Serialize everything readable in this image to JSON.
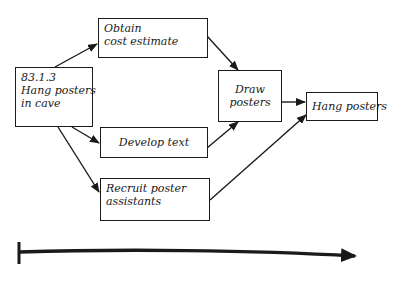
{
  "diagram": {
    "type": "activity-network",
    "nodes": [
      {
        "id": "root",
        "lines": [
          "83.1.3",
          "Hang posters",
          "in cave"
        ]
      },
      {
        "id": "cost",
        "lines": [
          "Obtain",
          "cost estimate"
        ]
      },
      {
        "id": "text",
        "lines": [
          "Develop text"
        ]
      },
      {
        "id": "recruit",
        "lines": [
          "Recruit poster",
          "assistants"
        ]
      },
      {
        "id": "draw",
        "lines": [
          "Draw",
          "posters"
        ]
      },
      {
        "id": "hang",
        "lines": [
          "Hang posters"
        ]
      }
    ],
    "edges": [
      {
        "from": "root",
        "to": "cost"
      },
      {
        "from": "root",
        "to": "text"
      },
      {
        "from": "root",
        "to": "recruit"
      },
      {
        "from": "cost",
        "to": "draw"
      },
      {
        "from": "text",
        "to": "draw"
      },
      {
        "from": "draw",
        "to": "hang"
      },
      {
        "from": "recruit",
        "to": "hang"
      }
    ],
    "timeline": {
      "direction": "left-to-right"
    }
  }
}
